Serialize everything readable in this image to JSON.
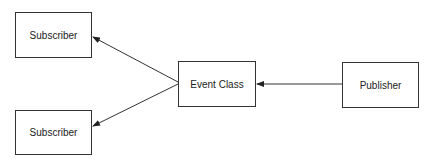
{
  "diagram": {
    "type": "publish-subscribe",
    "nodes": [
      {
        "id": "subscriber_top",
        "label": "Subscriber",
        "x": 15,
        "y": 12,
        "w": 77,
        "h": 46
      },
      {
        "id": "subscriber_bottom",
        "label": "Subscriber",
        "x": 15,
        "y": 110,
        "w": 77,
        "h": 45
      },
      {
        "id": "event_class",
        "label": "Event Class",
        "x": 178,
        "y": 61,
        "w": 78,
        "h": 46
      },
      {
        "id": "publisher",
        "label": "Publisher",
        "x": 342,
        "y": 62,
        "w": 77,
        "h": 46
      }
    ],
    "edges": [
      {
        "from": "publisher",
        "to": "event_class",
        "x1": 342,
        "y1": 84,
        "x2": 257,
        "y2": 84
      },
      {
        "from": "event_class",
        "to": "subscriber_top",
        "x1": 178,
        "y1": 82,
        "x2": 93,
        "y2": 37
      },
      {
        "from": "event_class",
        "to": "subscriber_bottom",
        "x1": 178,
        "y1": 84,
        "x2": 93,
        "y2": 126
      }
    ],
    "colors": {
      "stroke": "#333333",
      "text": "#222222",
      "background": "#ffffff"
    }
  }
}
